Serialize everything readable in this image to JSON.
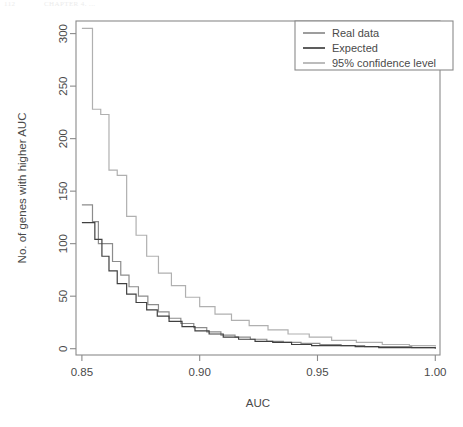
{
  "page_header": {
    "number": "112",
    "title": "CHAPTER 4. ..."
  },
  "chart_data": {
    "type": "line",
    "title": "",
    "xlabel": "AUC",
    "ylabel": "No. of genes with higher AUC",
    "xlim": [
      0.8475,
      1.002
    ],
    "ylim": [
      -6,
      312
    ],
    "xticks": [
      0.85,
      0.9,
      0.95,
      1.0
    ],
    "xticklabels": [
      "0.85",
      "0.90",
      "0.95",
      "1.00"
    ],
    "yticks": [
      0,
      50,
      100,
      150,
      200,
      250,
      300
    ],
    "yticklabels": [
      "0",
      "50",
      "100",
      "150",
      "200",
      "250",
      "300"
    ],
    "grid": false,
    "step_style": "post",
    "legend": {
      "position": "top-right",
      "entries": [
        {
          "label": "Real data",
          "color": "#8c8c8c"
        },
        {
          "label": "Expected",
          "color": "#404040"
        },
        {
          "label": "95% confidence level",
          "color": "#b0b0b0"
        }
      ]
    },
    "series": [
      {
        "name": "Real data",
        "color": "#8c8c8c",
        "x": [
          0.85,
          0.8525,
          0.8545,
          0.857,
          0.86,
          0.863,
          0.8665,
          0.87,
          0.874,
          0.878,
          0.8825,
          0.887,
          0.892,
          0.8975,
          0.903,
          0.909,
          0.915,
          0.9215,
          0.9285,
          0.9355,
          0.943,
          0.951,
          0.96,
          0.97,
          0.98,
          0.99,
          1.0
        ],
        "y": [
          137,
          137,
          121,
          100,
          100,
          83,
          70,
          59,
          50,
          42,
          35,
          29,
          24,
          20,
          16,
          13,
          11,
          9,
          7,
          6,
          5,
          4,
          3,
          2,
          2,
          1,
          1
        ]
      },
      {
        "name": "Expected",
        "color": "#404040",
        "x": [
          0.85,
          0.853,
          0.8555,
          0.8585,
          0.8615,
          0.865,
          0.869,
          0.873,
          0.8775,
          0.882,
          0.887,
          0.8925,
          0.898,
          0.904,
          0.91,
          0.9165,
          0.9235,
          0.931,
          0.939,
          0.9475,
          0.9565,
          0.966,
          0.976,
          0.986,
          0.995,
          1.0
        ],
        "y": [
          120,
          120,
          104,
          88,
          74,
          62,
          52,
          44,
          37,
          31,
          26,
          21,
          17,
          14,
          11,
          9,
          7,
          6,
          4,
          3,
          3,
          2,
          1,
          1,
          1,
          0
        ]
      },
      {
        "name": "95% confidence level",
        "color": "#b0b0b0",
        "x": [
          0.85,
          0.852,
          0.8545,
          0.858,
          0.8615,
          0.865,
          0.869,
          0.873,
          0.8775,
          0.8825,
          0.888,
          0.894,
          0.9,
          0.9065,
          0.9135,
          0.921,
          0.929,
          0.9375,
          0.9465,
          0.956,
          0.9665,
          0.9775,
          0.989,
          1.0
        ],
        "y": [
          305,
          305,
          228,
          223,
          170,
          165,
          126,
          108,
          88,
          72,
          60,
          49,
          40,
          33,
          27,
          22,
          18,
          14,
          11,
          8,
          6,
          4,
          3,
          2
        ]
      }
    ]
  }
}
